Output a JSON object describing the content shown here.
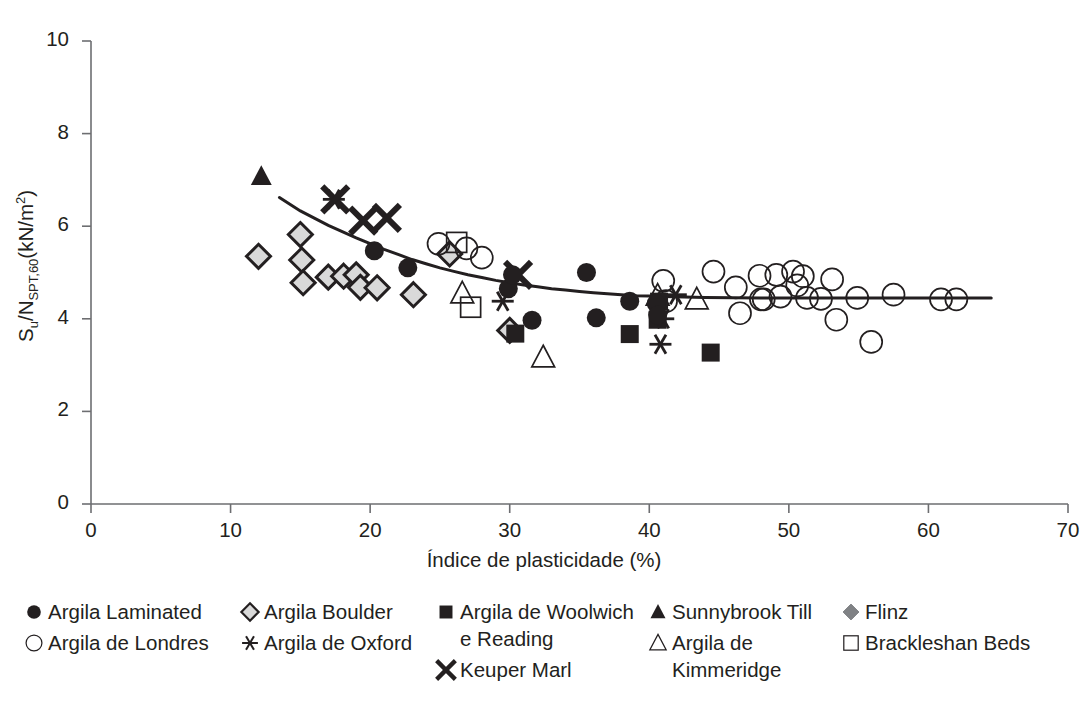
{
  "chart_data": {
    "type": "scatter",
    "title": "",
    "xlabel": "Índice de plasticidade (%)",
    "ylabel": "Su/NSPT,60(kN/m2)",
    "ylabel_parts": {
      "base1": "S",
      "sub1": "u",
      "mid": "/N",
      "sub2": "SPT,60",
      "tail": "(kN/m",
      "sup": "2",
      "close": ")"
    },
    "xlim": [
      0,
      70
    ],
    "ylim": [
      0,
      10
    ],
    "xticks": [
      0,
      10,
      20,
      30,
      40,
      50,
      60,
      70
    ],
    "yticks": [
      0,
      2,
      4,
      6,
      8,
      10
    ],
    "grid": false,
    "legend_position": "below",
    "series": [
      {
        "name": "Argila Laminated",
        "marker": "filled-circle",
        "points": [
          [
            20.3,
            5.47
          ],
          [
            22.7,
            5.1
          ],
          [
            29.9,
            4.65
          ],
          [
            30.2,
            4.95
          ],
          [
            31.6,
            3.97
          ],
          [
            35.5,
            5.0
          ],
          [
            36.2,
            4.02
          ],
          [
            38.6,
            4.38
          ],
          [
            40.5,
            4.33
          ],
          [
            40.6,
            4.08
          ]
        ]
      },
      {
        "name": "Argila de Londres",
        "marker": "open-circle",
        "points": [
          [
            24.9,
            5.62
          ],
          [
            26.9,
            5.52
          ],
          [
            28.0,
            5.32
          ],
          [
            41.0,
            4.82
          ],
          [
            41.2,
            4.38
          ],
          [
            44.6,
            5.02
          ],
          [
            46.2,
            4.68
          ],
          [
            46.5,
            4.12
          ],
          [
            47.9,
            4.93
          ],
          [
            48.0,
            4.42
          ],
          [
            48.2,
            4.42
          ],
          [
            49.1,
            4.95
          ],
          [
            49.4,
            4.48
          ],
          [
            50.3,
            5.02
          ],
          [
            50.6,
            4.72
          ],
          [
            51.0,
            4.92
          ],
          [
            51.3,
            4.45
          ],
          [
            52.3,
            4.43
          ],
          [
            53.1,
            4.85
          ],
          [
            53.4,
            3.98
          ],
          [
            54.9,
            4.45
          ],
          [
            55.9,
            3.5
          ],
          [
            57.5,
            4.52
          ],
          [
            60.9,
            4.42
          ],
          [
            62.0,
            4.42
          ]
        ]
      },
      {
        "name": "Argila Boulder",
        "marker": "gray-diamond",
        "points": [
          [
            12.0,
            5.35
          ],
          [
            15.0,
            5.82
          ],
          [
            15.1,
            5.27
          ],
          [
            15.2,
            4.78
          ],
          [
            17.0,
            4.9
          ],
          [
            18.1,
            4.92
          ],
          [
            19.0,
            4.95
          ],
          [
            19.3,
            4.68
          ],
          [
            20.5,
            4.67
          ],
          [
            23.1,
            4.52
          ],
          [
            25.7,
            5.4
          ],
          [
            30.0,
            3.75
          ]
        ]
      },
      {
        "name": "Argila de Oxford",
        "marker": "thin-asterisk",
        "points": [
          [
            17.4,
            6.58
          ],
          [
            29.5,
            4.38
          ],
          [
            41.0,
            4.0
          ],
          [
            41.9,
            4.52
          ],
          [
            40.8,
            3.45
          ]
        ]
      },
      {
        "name": "Argila de Woolwich\ne Reading",
        "marker": "filled-square",
        "points": [
          [
            30.4,
            3.68
          ],
          [
            38.6,
            3.67
          ],
          [
            40.7,
            4.37
          ],
          [
            40.6,
            3.98
          ],
          [
            44.4,
            3.27
          ]
        ]
      },
      {
        "name": "Keuper Marl",
        "marker": "bold-x",
        "points": [
          [
            17.5,
            6.58
          ],
          [
            19.5,
            6.12
          ],
          [
            21.2,
            6.18
          ],
          [
            30.6,
            4.95
          ]
        ]
      },
      {
        "name": "Sunnybrook Till",
        "marker": "filled-triangle",
        "points": [
          [
            12.2,
            7.08
          ]
        ]
      },
      {
        "name": "Argila de\nKimmeridge",
        "marker": "open-triangle",
        "points": [
          [
            26.6,
            4.55
          ],
          [
            32.4,
            3.17
          ],
          [
            40.6,
            4.5
          ],
          [
            43.4,
            4.42
          ]
        ]
      },
      {
        "name": "Flinz",
        "marker": "dark-diamond",
        "points": []
      },
      {
        "name": "Brackleshan Beds",
        "marker": "open-square",
        "points": [
          [
            26.2,
            5.65
          ],
          [
            27.2,
            4.25
          ]
        ]
      }
    ],
    "trend_curve": {
      "name": "fitted trend line",
      "points": [
        [
          13.5,
          6.62
        ],
        [
          15.0,
          6.33
        ],
        [
          17.0,
          6.02
        ],
        [
          19.0,
          5.75
        ],
        [
          21.0,
          5.5
        ],
        [
          23.0,
          5.28
        ],
        [
          25.0,
          5.1
        ],
        [
          27.0,
          4.95
        ],
        [
          29.0,
          4.83
        ],
        [
          31.0,
          4.73
        ],
        [
          33.0,
          4.65
        ],
        [
          35.0,
          4.59
        ],
        [
          37.0,
          4.54
        ],
        [
          39.0,
          4.5
        ],
        [
          41.0,
          4.48
        ],
        [
          44.0,
          4.46
        ],
        [
          48.0,
          4.45
        ],
        [
          52.0,
          4.45
        ],
        [
          56.0,
          4.45
        ],
        [
          60.0,
          4.45
        ],
        [
          64.5,
          4.45
        ]
      ]
    }
  },
  "axes": {
    "x_tick_labels": [
      "0",
      "10",
      "20",
      "30",
      "40",
      "50",
      "60",
      "70"
    ],
    "y_tick_labels": [
      "0",
      "2",
      "4",
      "6",
      "8",
      "10"
    ]
  },
  "legend": {
    "columns": [
      {
        "entries": [
          {
            "label": "Argila Laminated",
            "marker": "filled-circle"
          },
          {
            "label": "Argila de Londres",
            "marker": "open-circle"
          }
        ]
      },
      {
        "entries": [
          {
            "label": "Argila Boulder",
            "marker": "gray-diamond"
          },
          {
            "label": "Argila de Oxford",
            "marker": "thin-asterisk"
          }
        ]
      },
      {
        "entries": [
          {
            "label": "Argila de Woolwich\ne Reading",
            "marker": "filled-square"
          },
          {
            "label": "Keuper Marl",
            "marker": "bold-x"
          }
        ]
      },
      {
        "entries": [
          {
            "label": "Sunnybrook Till",
            "marker": "filled-triangle"
          },
          {
            "label": "Argila de\nKimmeridge",
            "marker": "open-triangle"
          }
        ]
      },
      {
        "entries": [
          {
            "label": "Flinz",
            "marker": "dark-diamond"
          },
          {
            "label": "Brackleshan Beds",
            "marker": "open-square"
          }
        ]
      }
    ]
  },
  "colors": {
    "ink": "#231f20",
    "axis": "#6d6e71",
    "marker_fill": "#231f20",
    "gray_fill": "#d9d9d9",
    "dark_gray_fill": "#808285",
    "background": "#ffffff"
  }
}
